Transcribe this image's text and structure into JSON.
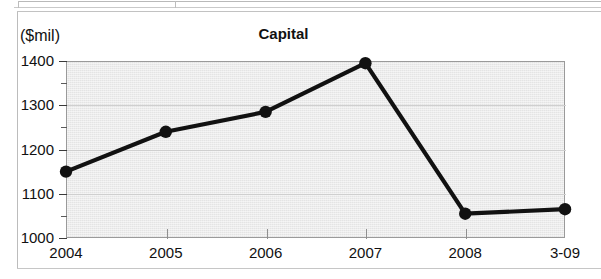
{
  "figure": {
    "title": "Capital",
    "unit_label": "($mil)"
  },
  "chart_data": {
    "type": "line",
    "title": "Capital",
    "xlabel": "",
    "ylabel": "($mil)",
    "categories": [
      "2004",
      "2005",
      "2006",
      "2007",
      "2008",
      "3-09"
    ],
    "values": [
      1150,
      1240,
      1285,
      1395,
      1055,
      1065
    ],
    "series": [
      {
        "name": "Capital",
        "values": [
          1150,
          1240,
          1285,
          1395,
          1055,
          1065
        ]
      }
    ],
    "ylim": [
      1000,
      1400
    ],
    "ytick_labels": [
      "1400",
      "1300",
      "1200",
      "1100",
      "1000"
    ],
    "ytick_values": [
      1400,
      1300,
      1200,
      1100,
      1000
    ],
    "yminor_tick_values": [
      1350,
      1250,
      1150,
      1050
    ],
    "ytick_step": 100,
    "grid": true,
    "grid_axis": "y",
    "legend": "none",
    "marker": "filled-circle",
    "line_color": "#111111",
    "marker_color": "#111111",
    "plot_background_color": "#e4e4e4"
  }
}
